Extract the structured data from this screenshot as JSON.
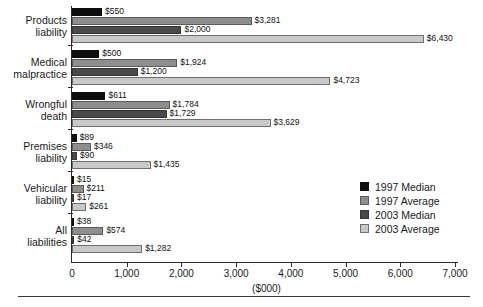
{
  "chart_data": {
    "type": "bar",
    "orientation": "horizontal",
    "title": "",
    "xlabel": "($000)",
    "ylabel": "",
    "xlim": [
      0,
      7000
    ],
    "grid": false,
    "legend_position": "middle-right",
    "categories": [
      "Products liability",
      "Medical malpractice",
      "Wrongful death",
      "Premises liability",
      "Vehicular liability",
      "All liabilities"
    ],
    "category_lines": [
      [
        "Products",
        "liability"
      ],
      [
        "Medical",
        "malpractice"
      ],
      [
        "Wrongful",
        "death"
      ],
      [
        "Premises",
        "liability"
      ],
      [
        "Vehicular",
        "liability"
      ],
      [
        "All",
        "liabilities"
      ]
    ],
    "xticks": [
      0,
      1000,
      2000,
      3000,
      4000,
      5000,
      6000,
      7000
    ],
    "xtick_labels": [
      "0",
      "1,000",
      "2,000",
      "3,000",
      "4,000",
      "5,000",
      "6,000",
      "7,000"
    ],
    "series": [
      {
        "name": "1997 Median",
        "color": "#0d0d0d",
        "values": [
          550,
          500,
          611,
          89,
          15,
          38
        ],
        "labels": [
          "$550",
          "$500",
          "$611",
          "$89",
          "$15",
          "$38"
        ]
      },
      {
        "name": "1997 Average",
        "color": "#8e8e8e",
        "values": [
          3281,
          1924,
          1784,
          346,
          211,
          574
        ],
        "labels": [
          "$3,281",
          "$1,924",
          "$1,784",
          "$346",
          "$211",
          "$574"
        ]
      },
      {
        "name": "2003 Median",
        "color": "#4a4a4a",
        "values": [
          2000,
          1200,
          1729,
          90,
          17,
          42
        ],
        "labels": [
          "$2,000",
          "$1,200",
          "$1,729",
          "$90",
          "$17",
          "$42"
        ]
      },
      {
        "name": "2003 Average",
        "color": "#c9c9c9",
        "values": [
          6430,
          4723,
          3629,
          1435,
          261,
          1282
        ],
        "labels": [
          "$6,430",
          "$4,723",
          "$3,629",
          "$1,435",
          "$261",
          "$1,282"
        ]
      }
    ]
  },
  "legend": {
    "items": [
      {
        "label": "1997 Median",
        "color": "#0d0d0d"
      },
      {
        "label": "1997 Average",
        "color": "#8e8e8e"
      },
      {
        "label": "2003 Median",
        "color": "#4a4a4a"
      },
      {
        "label": "2003 Average",
        "color": "#c9c9c9"
      }
    ]
  },
  "axis": {
    "x_title": "($000)"
  }
}
